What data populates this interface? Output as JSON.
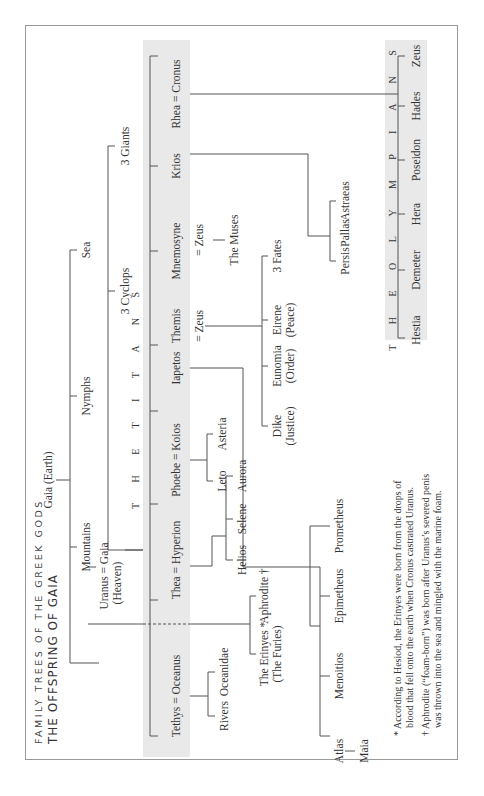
{
  "header": {
    "supertitle": "FAMILY TREES OF THE GREEK GODS",
    "title": "THE OFFSPRING OF GAIA"
  },
  "root": {
    "gaia": "Gaia (Earth)",
    "children": [
      "Mountains",
      "Nymphs",
      "Sea"
    ],
    "uranus_pair_line1": "Uranus = Gaia",
    "uranus_pair_line2": "(Heaven)",
    "other_offspring": [
      "3 Cyclops",
      "3 Giants"
    ]
  },
  "titans": {
    "band_label": "T H E   T I T A N S",
    "members": [
      "Tethys = Oceanus",
      "Thea = Hyperion",
      "Phoebe = Koios",
      "Iapetos",
      "Themis",
      "Mnemosyne",
      "Krios",
      "Rhea = Cronus"
    ]
  },
  "descendants": {
    "oceanus": [
      "Rivers",
      "Oceanidae"
    ],
    "erinyes_line1": "The Erinyes *",
    "erinyes_line2": "(The Furies)",
    "aphrodite": "Aphrodite †",
    "hyperion": [
      "Helios",
      "Selene",
      "Aurora"
    ],
    "koios": [
      "Leto",
      "Asteria"
    ],
    "iapetos": [
      "Atlas",
      "Menoitios",
      "Epimetheus",
      "Prometheus"
    ],
    "atlas_child": "Maia",
    "themis_spouse": "= Zeus",
    "themis_children": [
      {
        "line1": "Dike",
        "line2": "(Justice)"
      },
      {
        "line1": "Eunomia",
        "line2": "(Order)"
      },
      {
        "line1": "Eirene",
        "line2": "(Peace)"
      },
      {
        "line1": "3 Fates",
        "line2": ""
      }
    ],
    "mnemosyne_spouse": "= Zeus",
    "mnemosyne_children": "The Muses",
    "krios": [
      "Persis",
      "Pallas",
      "Astraeas"
    ]
  },
  "olympians": {
    "band_label": "T H E   O L Y M P I A N S",
    "members": [
      "Hestia",
      "Demeter",
      "Hera",
      "Poseidon",
      "Hades",
      "Zeus"
    ]
  },
  "footnotes": [
    {
      "line1": "* According to Hesiod, the Erinyes were born from the drops of",
      "line2": "blood that fell onto the earth when Cronus castrated Uranus."
    },
    {
      "line1": "† Aphrodite (“foam-born”) was born after Uranus’s severed penis",
      "line2": "was thrown into the sea and mingled with the marine foam."
    }
  ]
}
